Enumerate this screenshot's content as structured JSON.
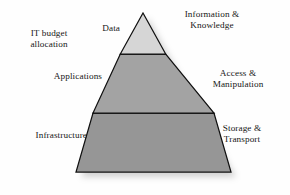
{
  "diagram": {
    "type": "three-tier-pyramid",
    "annotation": {
      "label": "IT budget\nallocation"
    },
    "tiers": [
      {
        "id": "data",
        "left_label": "Data",
        "right_label": "Information &\nKnowledge",
        "fill": "#d6d6d6",
        "stroke": "#101010"
      },
      {
        "id": "applications",
        "left_label": "Applications",
        "right_label": "Access &\nManipulation",
        "fill": "#a3a3a3",
        "stroke": "#101010"
      },
      {
        "id": "infrastructure",
        "left_label": "Infrastructure",
        "right_label": "Storage &\nTransport",
        "fill": "#969696",
        "stroke": "#101010"
      }
    ],
    "geometry": {
      "apex_x": 143,
      "apex_y": 13,
      "base_left_x": 76,
      "base_right_x": 231,
      "base_y": 172,
      "divider_1_y": 54,
      "divider_2_y": 113
    },
    "colors": {
      "background": "#fefefe",
      "text": "#161616",
      "outline": "#101010",
      "shadow": "#b4b4b4"
    }
  }
}
